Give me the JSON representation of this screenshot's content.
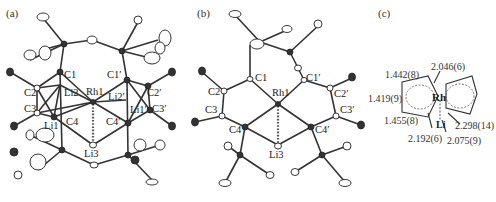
{
  "figure": {
    "panels": [
      {
        "id": "a",
        "label": "(a)",
        "atom_labels": {
          "C1": "C1",
          "C2": "C2",
          "C3": "C3",
          "C4": "C4",
          "Li1": "Li1",
          "Li2": "Li2",
          "Rh1": "Rh1",
          "Li3": "Li3",
          "C1p": "C1′",
          "C2p": "C2′",
          "C3p": "C3′",
          "C4p": "C4′",
          "Li1p": "Li1′",
          "Li2p": "Li2′"
        }
      },
      {
        "id": "b",
        "label": "(b)",
        "atom_labels": {
          "C1": "C1",
          "C2": "C2",
          "C3": "C3",
          "C4": "C4",
          "Rh1": "Rh1",
          "Li3": "Li3",
          "C1p": "C1′",
          "C2p": "C2′",
          "C3p": "C3′",
          "C4p": "C4′"
        }
      },
      {
        "id": "c",
        "label": "(c)",
        "center_atom": "Rh",
        "bridge_atom": "Li",
        "bond_lengths": {
          "top_ring_bond": "1.442(8)",
          "left_ring_bond": "1.419(9)",
          "bottom_ring_bond": "1.455(8)",
          "rh_c1": "2.046(6)",
          "rh_c4": "2.192(6)",
          "rh_li": "2.298(14)",
          "li_c": "2.075(9)"
        }
      }
    ]
  }
}
